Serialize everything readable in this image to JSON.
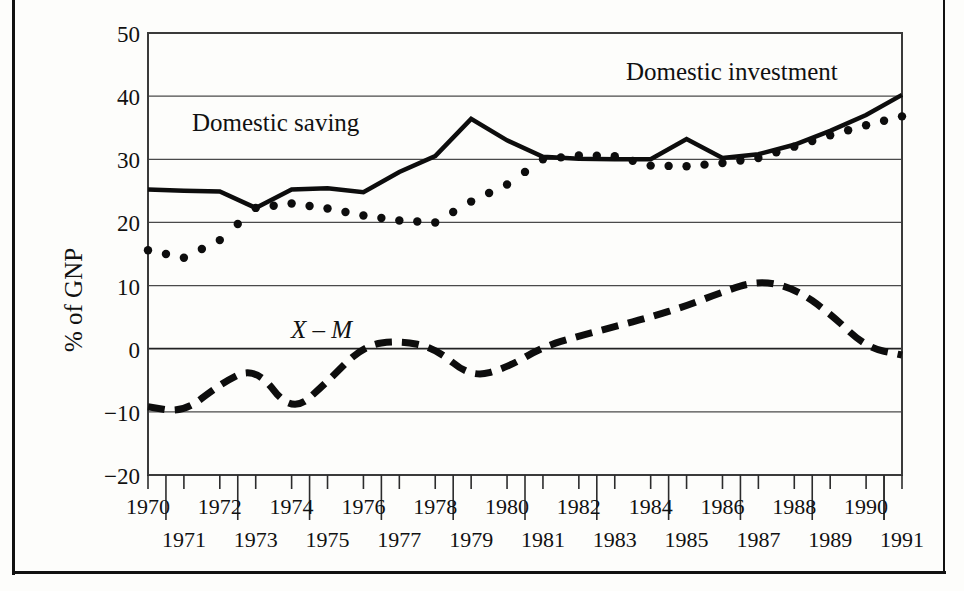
{
  "figure": {
    "ylabel": "% of GNP",
    "series_labels": {
      "saving": "Domestic saving",
      "investment": "Domestic investment",
      "net_exports": "X – M"
    }
  },
  "chart_data": {
    "type": "line",
    "title": "",
    "xlabel": "",
    "ylabel": "% of GNP",
    "xlim": [
      1970,
      1991
    ],
    "ylim": [
      -20,
      50
    ],
    "yticks": [
      50,
      40,
      30,
      20,
      10,
      0,
      -10,
      -20
    ],
    "ytick_labels": [
      "50",
      "40",
      "30",
      "20",
      "10",
      "0",
      "−10",
      "−20"
    ],
    "grid": "horizontal",
    "legend": "inline-annotations",
    "x": [
      1970,
      1971,
      1972,
      1973,
      1974,
      1975,
      1976,
      1977,
      1978,
      1979,
      1980,
      1981,
      1982,
      1983,
      1984,
      1985,
      1986,
      1987,
      1988,
      1989,
      1990,
      1991
    ],
    "xtick_labels_row1": [
      "1970",
      "1972",
      "1974",
      "1976",
      "1978",
      "1980",
      "1982",
      "1984",
      "1986",
      "1988",
      "1990"
    ],
    "xtick_labels_row2": [
      "1971",
      "1973",
      "1975",
      "1977",
      "1979",
      "1981",
      "1983",
      "1985",
      "1987",
      "1989",
      "1991"
    ],
    "series": [
      {
        "name": "Domestic saving",
        "style": "solid",
        "color": "#0d0d0d",
        "values": [
          25.2,
          25.0,
          24.9,
          22.3,
          25.2,
          25.4,
          24.8,
          28.0,
          30.5,
          36.4,
          33.0,
          30.4,
          30.1,
          30.0,
          30.0,
          33.2,
          30.2,
          30.8,
          32.3,
          34.5,
          37.0,
          40.2
        ]
      },
      {
        "name": "Domestic investment",
        "style": "dotted",
        "color": "#0d0d0d",
        "values": [
          15.6,
          14.4,
          17.2,
          22.3,
          23.0,
          22.2,
          21.1,
          20.3,
          20.0,
          23.3,
          26.0,
          30.0,
          30.6,
          30.5,
          29.0,
          28.9,
          29.4,
          30.2,
          32.0,
          33.8,
          35.4,
          36.8
        ]
      },
      {
        "name": "X – M",
        "style": "dashed",
        "color": "#0d0d0d",
        "values": [
          -9.2,
          -10.1,
          -5.6,
          -2.8,
          -10.3,
          -5.2,
          0.5,
          1.3,
          0.1,
          -4.6,
          -3.0,
          0.3,
          2.0,
          3.5,
          5.0,
          6.8,
          9.0,
          10.8,
          9.6,
          5.6,
          0.2,
          -1.0
        ]
      }
    ],
    "series_annotations": [
      {
        "text": "Domestic saving",
        "x": 1971.5,
        "y": 36.5
      },
      {
        "text": "Domestic investment",
        "x": 1983.5,
        "y": 44.5
      },
      {
        "text": "X – M",
        "x": 1974.5,
        "y": 4.5
      }
    ]
  }
}
